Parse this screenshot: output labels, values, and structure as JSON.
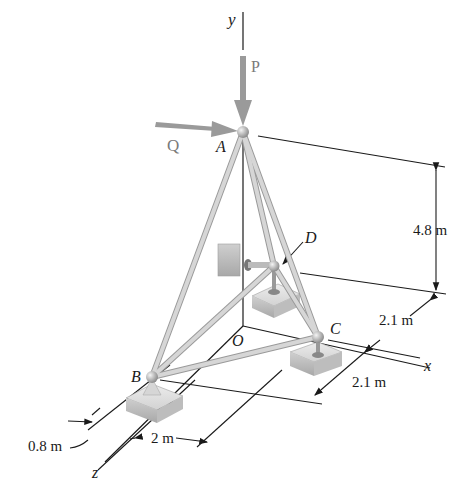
{
  "figure": {
    "type": "3D truss / tripod structure",
    "axes": {
      "x": "x",
      "y": "y",
      "z": "z",
      "origin": "O"
    },
    "points": {
      "A": "A",
      "B": "B",
      "C": "C",
      "D": "D"
    },
    "loads": {
      "P": "P",
      "Q": "Q"
    },
    "dimensions": {
      "height": "4.8 m",
      "c_offset_back": "2.1 m",
      "c_offset_front": "2.1 m",
      "b_offset_x": "2 m",
      "b_offset_left": "0.8 m"
    }
  },
  "colors": {
    "member": "#c8c8c8",
    "member_edge": "#9a9a9a",
    "load_arrow": "#9a9a9a",
    "line": "#1a1a1a",
    "support": "#d0d0d0"
  }
}
